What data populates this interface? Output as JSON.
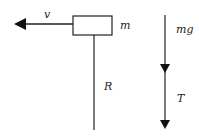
{
  "diagram": {
    "labels": {
      "velocity": "v",
      "mass": "m",
      "reaction": "R",
      "weight": "mg",
      "tension": "T"
    },
    "colors": {
      "stroke": "#222222",
      "background": "#ffffff"
    }
  }
}
